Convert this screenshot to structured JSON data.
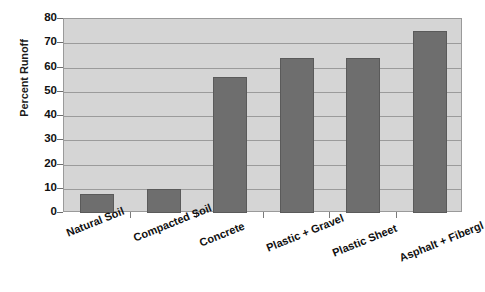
{
  "chart_data": {
    "type": "bar",
    "title": "",
    "xlabel": "",
    "ylabel": "Percent Runoff",
    "categories": [
      "Natural Soil",
      "Compacted Soil",
      "Concrete",
      "Plastic + Gravel",
      "Plastic Sheet",
      "Asphalt + Fibergl"
    ],
    "values": [
      8,
      10,
      56,
      64,
      64,
      75
    ],
    "ylim": [
      0,
      80
    ],
    "ytick_labels": [
      "80",
      "70",
      "60",
      "50",
      "40",
      "30",
      "20",
      "10",
      "0"
    ],
    "ytick_values": [
      80,
      70,
      60,
      50,
      40,
      30,
      20,
      10,
      0
    ],
    "grid": true,
    "legend": "none",
    "colors": {
      "bar_fill": "#6e6e6e",
      "bar_border": "#5a5a5a",
      "plot_background": "#d5d5d5",
      "gridline": "#9b9b9b",
      "axis_border": "#9a9a9a",
      "text": "#111111",
      "page_background": "#ffffff"
    }
  }
}
